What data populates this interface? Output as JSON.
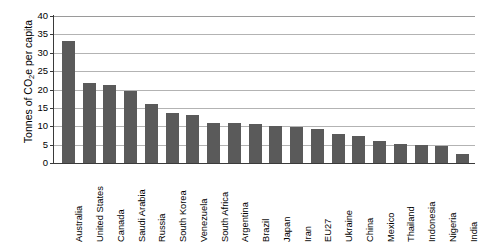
{
  "chart_data": {
    "type": "bar",
    "title": "",
    "xlabel": "",
    "ylabel": "Tonnes of CO2e per capita",
    "ylabel_parts": {
      "pre": "Tonnes of CO",
      "sub": "2",
      "post": "e per capita"
    },
    "ylim": [
      0,
      40
    ],
    "ytick_labels": [
      "0",
      "5",
      "10",
      "15",
      "20",
      "25",
      "30",
      "35",
      "40"
    ],
    "ytick_values": [
      0,
      5,
      10,
      15,
      20,
      25,
      30,
      35,
      40
    ],
    "grid": true,
    "grid_axis": "y",
    "legend": "none",
    "bar_color": "#5a5a5a",
    "categories": [
      "Australia",
      "United States",
      "Canada",
      "Saudi Arabia",
      "Russia",
      "South Korea",
      "Venezuela",
      "South Africa",
      "Argentina",
      "Brazil",
      "Japan",
      "Iran",
      "EU27",
      "Ukraine",
      "China",
      "Mexico",
      "Thailand",
      "Indonesia",
      "Nigeria",
      "India"
    ],
    "values": [
      33.3,
      21.9,
      21.2,
      19.7,
      16.0,
      13.6,
      13.2,
      10.9,
      10.9,
      10.6,
      10.0,
      9.7,
      9.3,
      8.0,
      7.4,
      6.1,
      5.2,
      4.9,
      4.6,
      2.5
    ]
  }
}
